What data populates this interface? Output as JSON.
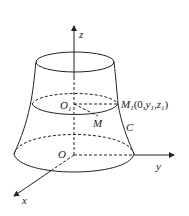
{
  "labels": {
    "z": "z",
    "y": "y",
    "x": "x",
    "O": "O",
    "O1": "O",
    "O1_sub": "1",
    "M": "M",
    "C": "C",
    "M1": "M",
    "M1_sub": "1",
    "M1_coords_open": "(0,",
    "M1_y": "y",
    "M1_y_sub": "1",
    "M1_comma": ",",
    "M1_z": "z",
    "M1_z_sub": "1",
    "M1_close": ")"
  },
  "colors": {
    "stroke": "#222222",
    "background": "#ffffff"
  }
}
